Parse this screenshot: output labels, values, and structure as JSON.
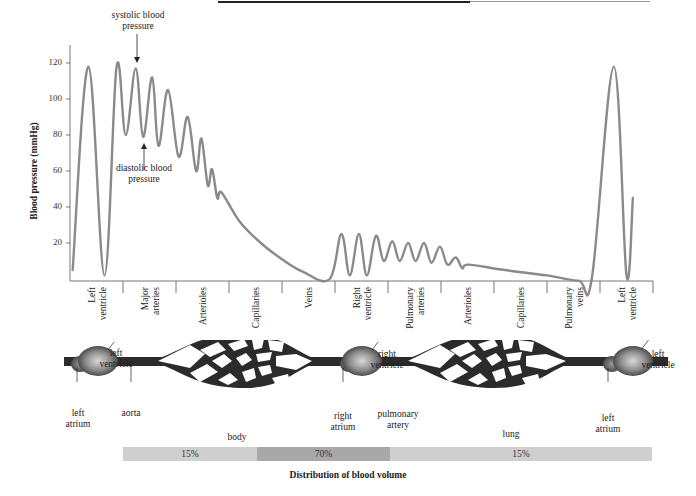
{
  "figure": {
    "annotations": {
      "systolic": "systolic blood\npressure",
      "diastolic": "diastolic blood\npressure"
    },
    "circulation_labels": {
      "left_ventricle_1": "left\nventricle",
      "left_atrium_1": "left\natrium",
      "aorta": "aorta",
      "body": "body",
      "right_ventricle": "right\nventricle",
      "right_atrium": "right\natrium",
      "pulmonary_artery": "pulmonary\nartery",
      "lung": "lung",
      "left_ventricle_2": "left\nventricle",
      "left_atrium_2": "left\natrium"
    },
    "colors": {
      "curve": "#8a8a8a",
      "axis": "#777777",
      "vessel": "#2b2b2b",
      "bar_light": "#cfcfcf",
      "bar_dark": "#a8a8a8"
    }
  },
  "chart_data": {
    "type": "line",
    "title": "",
    "xlabel": "",
    "ylabel": "Blood pressure (mmHg)",
    "ylim": [
      0,
      130
    ],
    "yticks": [
      20,
      40,
      60,
      80,
      100,
      120
    ],
    "grid": false,
    "categories": [
      "Left ventricle",
      "Major arteries",
      "Arterioles",
      "Capillaries",
      "Veins",
      "Right ventricle",
      "Pulmonary arteries",
      "Arterioles",
      "Capillaries",
      "Pulmonary veins",
      "Left ventricle"
    ],
    "series": [
      {
        "name": "Blood pressure",
        "points": [
          [
            0.05,
            5
          ],
          [
            0.35,
            118
          ],
          [
            0.65,
            2
          ],
          [
            0.88,
            118
          ],
          [
            1.05,
            80
          ],
          [
            1.24,
            117
          ],
          [
            1.38,
            79
          ],
          [
            1.55,
            112
          ],
          [
            1.67,
            74
          ],
          [
            1.85,
            105
          ],
          [
            2.05,
            68
          ],
          [
            2.22,
            90
          ],
          [
            2.38,
            60
          ],
          [
            2.48,
            78
          ],
          [
            2.6,
            52
          ],
          [
            2.68,
            61
          ],
          [
            2.78,
            45
          ],
          [
            2.86,
            48
          ],
          [
            3.2,
            32
          ],
          [
            3.6,
            20
          ],
          [
            4.0,
            11
          ],
          [
            4.4,
            4
          ],
          [
            4.9,
            0
          ],
          [
            5.12,
            25
          ],
          [
            5.28,
            2
          ],
          [
            5.45,
            25
          ],
          [
            5.6,
            2
          ],
          [
            5.77,
            24
          ],
          [
            5.92,
            10
          ],
          [
            6.08,
            21
          ],
          [
            6.22,
            10
          ],
          [
            6.38,
            20
          ],
          [
            6.52,
            10
          ],
          [
            6.68,
            20
          ],
          [
            6.82,
            9
          ],
          [
            6.98,
            18
          ],
          [
            7.12,
            8
          ],
          [
            7.28,
            12
          ],
          [
            7.4,
            6
          ],
          [
            7.52,
            8
          ],
          [
            8.2,
            5
          ],
          [
            9.0,
            2
          ],
          [
            9.6,
            -1
          ],
          [
            9.85,
            1
          ],
          [
            10.26,
            118
          ],
          [
            10.5,
            2
          ],
          [
            10.62,
            45
          ]
        ]
      }
    ],
    "annotations": [
      "systolic blood pressure",
      "diastolic blood pressure"
    ]
  },
  "distribution": {
    "title": "Distribution of blood volume",
    "segments": [
      {
        "label": "15%",
        "value": 15,
        "shade": "light"
      },
      {
        "label": "70%",
        "value": 70,
        "shade": "dark"
      },
      {
        "label": "15%",
        "value": 15,
        "shade": "light"
      }
    ]
  }
}
